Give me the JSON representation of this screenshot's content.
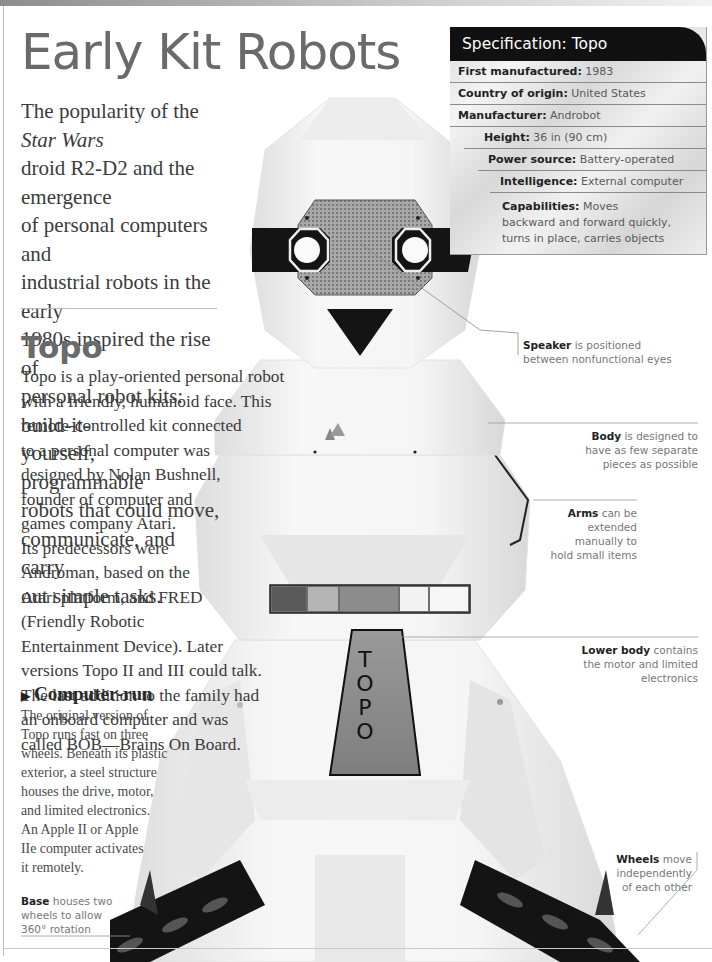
{
  "page": {
    "title": "Early Kit Robots",
    "intro_lines": {
      "l1_pre": "The popularity of the ",
      "l1_em": "Star Wars",
      "l2": "droid R2-D2 and the emergence",
      "l3": "of personal computers and",
      "l4": "industrial robots in the early",
      "l5": "1980s inspired the rise of",
      "l6": "personal robot kits: build-it-",
      "l7": "yourself, programmable",
      "l8": "robots that could move,",
      "l9": "communicate, and carry",
      "l10": "out simple tasks."
    }
  },
  "section": {
    "title": "Topo",
    "body_lines": [
      "Topo is a play-oriented personal robot",
      "with a friendly, humanoid face. This",
      "remote-controlled kit connected",
      "to a personal computer was",
      "designed by Nolan Bushnell,",
      "founder of computer and",
      "games company Atari.",
      "Its predecessors were",
      "Androman, based on the",
      "Atari platform, and FRED",
      "(Friendly Robotic",
      "Entertainment Device). Later",
      "versions Topo II and III could talk.",
      "The last addition to the family had",
      "an onboard computer and was",
      "called BOB—Brains On Board."
    ]
  },
  "subsection": {
    "marker": "▶",
    "title": "Computer-run",
    "body_lines": [
      "The original version of",
      "Topo runs fast on three",
      "wheels. Beneath its plastic",
      "exterior, a steel structure",
      "houses the drive, motor,",
      "and limited electronics.",
      "An Apple II or Apple",
      "IIe computer activates",
      "it remotely."
    ]
  },
  "spec": {
    "header": "Specification: Topo",
    "rows": [
      {
        "label": "First manufactured:",
        "value": " 1983",
        "indent": 8
      },
      {
        "label": "Country of origin:",
        "value": " United States",
        "indent": 8
      },
      {
        "label": "Manufacturer:",
        "value": " Androbot",
        "indent": 8
      },
      {
        "label": "Height:",
        "value": " 36 in (90 cm)",
        "indent": 20
      },
      {
        "label": "Power source:",
        "value": " Battery-operated",
        "indent": 38
      },
      {
        "label": "Intelligence:",
        "value": " External computer",
        "indent": 50
      },
      {
        "label": "Capabilities:",
        "value": " Moves backward and forward quickly, turns in place, carries objects",
        "indent": 52
      }
    ]
  },
  "callouts": {
    "speaker": {
      "bold": "Speaker",
      "text": " is positioned",
      "line2": "between nonfunctional eyes"
    },
    "body": {
      "bold": "Body",
      "text": " is designed to",
      "line2": "have as few separate",
      "line3": "pieces as possible"
    },
    "arms": {
      "bold": "Arms",
      "text": " can be",
      "line2": "extended",
      "line3": "manually to",
      "line4": "hold small items"
    },
    "lower_body": {
      "bold": "Lower body",
      "text": " contains",
      "line2": "the motor and limited",
      "line3": "electronics"
    },
    "wheels": {
      "bold": "Wheels",
      "text": " move",
      "line2": "independently",
      "line3": "of each other"
    },
    "base": {
      "bold": "Base",
      "text": " houses two",
      "line2": "wheels to allow",
      "line3": "360° rotation"
    }
  },
  "robot": {
    "chest_label_letters": [
      "T",
      "O",
      "P",
      "O"
    ],
    "colors": {
      "shell": "#f4f4f4",
      "shade": "#dedede",
      "dark": "#111111",
      "panel": "#8c8c8c",
      "grille": "#9a9a9a"
    }
  }
}
